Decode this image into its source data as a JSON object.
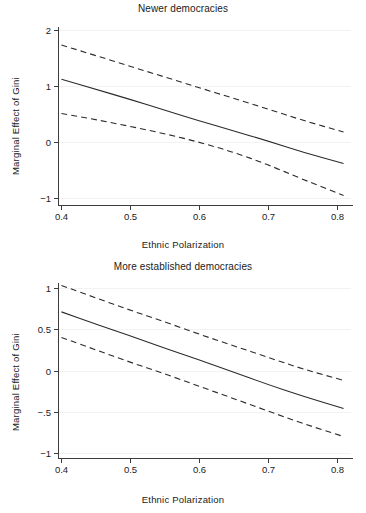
{
  "figure": {
    "background": "#ffffff",
    "line_color": "#2b2b2b",
    "axis_color": "#3c3c3c",
    "grid_color": "#f2f2f2"
  },
  "chart_data": [
    {
      "type": "line",
      "panel": "top",
      "title": "Newer democracies",
      "xlabel": "Ethnic Polarization",
      "ylabel": "Marginal Effect of  Gini",
      "xlim": [
        0.395,
        0.815
      ],
      "ylim": [
        -1.12,
        2.05
      ],
      "xticks": [
        0.4,
        0.5,
        0.6,
        0.7,
        0.8
      ],
      "xticklabels": [
        "0.4",
        "0.5",
        "0.6",
        "0.7",
        "0.8"
      ],
      "yticks": [
        2,
        1,
        0,
        -1
      ],
      "yticklabels": [
        "2",
        "1",
        "0",
        "−1"
      ],
      "grid": "horizontal-faint",
      "legend": "none",
      "x": [
        0.4,
        0.45,
        0.5,
        0.55,
        0.6,
        0.65,
        0.7,
        0.75,
        0.81
      ],
      "series": [
        {
          "name": "Upper 95% confidence bound",
          "style": "dashed",
          "values": [
            1.73,
            1.54,
            1.35,
            1.16,
            0.97,
            0.78,
            0.59,
            0.39,
            0.18
          ]
        },
        {
          "name": "Marginal effect",
          "style": "solid",
          "values": [
            1.12,
            0.94,
            0.76,
            0.57,
            0.38,
            0.2,
            0.02,
            -0.18,
            -0.38
          ]
        },
        {
          "name": "Lower 95% confidence bound",
          "style": "dashed",
          "values": [
            0.51,
            0.4,
            0.28,
            0.15,
            0.0,
            -0.18,
            -0.4,
            -0.66,
            -0.95
          ]
        }
      ]
    },
    {
      "type": "line",
      "panel": "bottom",
      "title": "More established democracies",
      "xlabel": "Ethnic Polarization",
      "ylabel": "Marginal Effect of  Gini",
      "xlim": [
        0.395,
        0.815
      ],
      "ylim": [
        -1.06,
        1.06
      ],
      "xticks": [
        0.4,
        0.5,
        0.6,
        0.7,
        0.8
      ],
      "xticklabels": [
        "0.4",
        "0.5",
        "0.6",
        "0.7",
        "0.8"
      ],
      "yticks": [
        1,
        0.5,
        0,
        -0.5,
        -1
      ],
      "yticklabels": [
        "1",
        "0.5",
        "0",
        "−.5",
        "−1"
      ],
      "grid": "horizontal-faint",
      "legend": "none",
      "x": [
        0.4,
        0.45,
        0.5,
        0.55,
        0.6,
        0.65,
        0.7,
        0.75,
        0.81
      ],
      "series": [
        {
          "name": "Upper 95% confidence bound",
          "style": "dashed",
          "values": [
            1.03,
            0.88,
            0.73,
            0.59,
            0.44,
            0.3,
            0.16,
            0.02,
            -0.12
          ]
        },
        {
          "name": "Marginal effect",
          "style": "solid",
          "values": [
            0.71,
            0.56,
            0.42,
            0.27,
            0.13,
            -0.02,
            -0.17,
            -0.31,
            -0.46
          ]
        },
        {
          "name": "Lower 95% confidence bound",
          "style": "dashed",
          "values": [
            0.4,
            0.25,
            0.1,
            -0.04,
            -0.19,
            -0.34,
            -0.49,
            -0.64,
            -0.8
          ]
        }
      ]
    }
  ]
}
